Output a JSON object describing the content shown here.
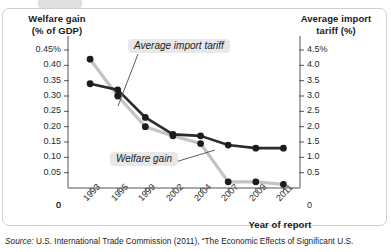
{
  "figure": {
    "left_axis_title_line1": "Welfare gain",
    "left_axis_title_line2": "(% of GDP)",
    "right_axis_title_line1": "Average import",
    "right_axis_title_line2": "tariff (%)",
    "x_axis_title": "Year of report",
    "source_prefix": "Source:",
    "source_text": "U.S. International Trade Commission (2011), “The Economic Effects of Significant U.S.",
    "annotation_tariff": "Average import tariff",
    "annotation_welfare": "Welfare gain",
    "colors": {
      "welfare_line": "#2b2b2b",
      "tariff_line": "#c4c4c4",
      "axis": "#555555",
      "panel_border": "#cfcfcf",
      "annotation_bg": "#e8e8e8",
      "text": "#1a1a1a"
    }
  },
  "chart_data": {
    "type": "line",
    "title": "",
    "xlabel": "Year of report",
    "categories": [
      "1993",
      "1995",
      "1999",
      "2002",
      "2004",
      "2007",
      "2009",
      "2011"
    ],
    "series": [
      {
        "name": "Welfare gain",
        "axis": "left",
        "unit": "% of GDP",
        "color": "#2b2b2b",
        "values": [
          0.34,
          0.32,
          0.23,
          0.175,
          0.17,
          0.14,
          0.13,
          0.13
        ]
      },
      {
        "name": "Average import tariff",
        "axis": "right",
        "unit": "%",
        "color": "#c4c4c4",
        "values": [
          4.2,
          3.0,
          2.0,
          1.7,
          1.45,
          0.2,
          0.2,
          0.12
        ]
      }
    ],
    "left_axis": {
      "label": "Welfare gain (% of GDP)",
      "ylim": [
        0,
        0.45
      ],
      "ticks": [
        0.45,
        0.4,
        0.35,
        0.3,
        0.25,
        0.2,
        0.15,
        0.1,
        0.05,
        0
      ],
      "tick_labels": [
        "0.45%",
        "0.40",
        "0.35",
        "0.30",
        "0.25",
        "0.20",
        "0.15",
        "0.10",
        "0.05",
        "0"
      ]
    },
    "right_axis": {
      "label": "Average import tariff (%)",
      "ylim": [
        0,
        4.5
      ],
      "ticks": [
        4.5,
        4.0,
        3.5,
        3.0,
        2.5,
        2.0,
        1.5,
        1.0,
        0.5,
        0
      ],
      "tick_labels": [
        "4.5%",
        "4.0",
        "3.5",
        "3.0",
        "2.5",
        "2.0",
        "1.5",
        "1.0",
        "0.5",
        "0"
      ]
    },
    "grid": false,
    "legend": "annotations"
  }
}
